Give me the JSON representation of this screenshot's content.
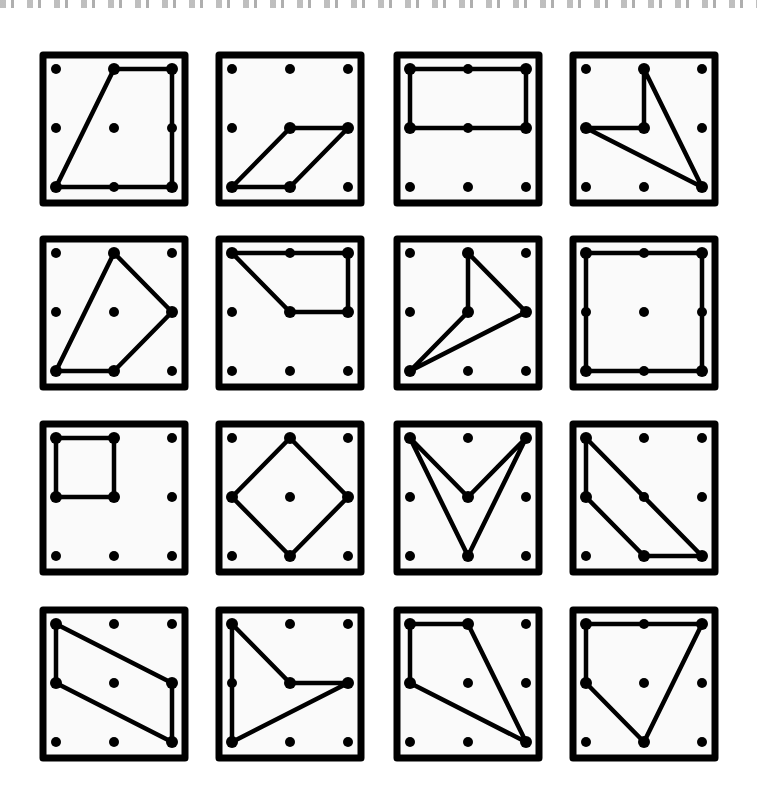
{
  "figure": {
    "grid_size": 3,
    "stroke_color": "#000000",
    "background_color": "#ffffff",
    "board_fill": "#fafafa",
    "boards": [
      {
        "id": 1,
        "row": 0,
        "col": 0,
        "vertices": [
          [
            1,
            0
          ],
          [
            2,
            0
          ],
          [
            2,
            2
          ],
          [
            0,
            2
          ]
        ]
      },
      {
        "id": 2,
        "row": 0,
        "col": 1,
        "vertices": [
          [
            1,
            1
          ],
          [
            2,
            1
          ],
          [
            1,
            2
          ],
          [
            0,
            2
          ]
        ]
      },
      {
        "id": 3,
        "row": 0,
        "col": 2,
        "vertices": [
          [
            0,
            0
          ],
          [
            2,
            0
          ],
          [
            2,
            1
          ],
          [
            0,
            1
          ]
        ]
      },
      {
        "id": 4,
        "row": 0,
        "col": 3,
        "vertices": [
          [
            1,
            0
          ],
          [
            2,
            2
          ],
          [
            0,
            1
          ],
          [
            1,
            1
          ]
        ]
      },
      {
        "id": 5,
        "row": 1,
        "col": 0,
        "vertices": [
          [
            1,
            0
          ],
          [
            2,
            1
          ],
          [
            1,
            2
          ],
          [
            0,
            2
          ]
        ]
      },
      {
        "id": 6,
        "row": 1,
        "col": 1,
        "vertices": [
          [
            0,
            0
          ],
          [
            2,
            0
          ],
          [
            2,
            1
          ],
          [
            1,
            1
          ]
        ]
      },
      {
        "id": 7,
        "row": 1,
        "col": 2,
        "vertices": [
          [
            1,
            0
          ],
          [
            2,
            1
          ],
          [
            0,
            2
          ],
          [
            1,
            1
          ]
        ]
      },
      {
        "id": 8,
        "row": 1,
        "col": 3,
        "vertices": [
          [
            0,
            0
          ],
          [
            2,
            0
          ],
          [
            2,
            2
          ],
          [
            0,
            2
          ]
        ]
      },
      {
        "id": 9,
        "row": 2,
        "col": 0,
        "vertices": [
          [
            0,
            0
          ],
          [
            1,
            0
          ],
          [
            1,
            1
          ],
          [
            0,
            1
          ]
        ]
      },
      {
        "id": 10,
        "row": 2,
        "col": 1,
        "vertices": [
          [
            1,
            0
          ],
          [
            2,
            1
          ],
          [
            1,
            2
          ],
          [
            0,
            1
          ]
        ]
      },
      {
        "id": 11,
        "row": 2,
        "col": 2,
        "vertices": [
          [
            0,
            0
          ],
          [
            1,
            1
          ],
          [
            2,
            0
          ],
          [
            1,
            2
          ]
        ]
      },
      {
        "id": 12,
        "row": 2,
        "col": 3,
        "vertices": [
          [
            0,
            0
          ],
          [
            2,
            2
          ],
          [
            1,
            2
          ],
          [
            0,
            1
          ]
        ]
      },
      {
        "id": 13,
        "row": 3,
        "col": 0,
        "vertices": [
          [
            0,
            0
          ],
          [
            2,
            1
          ],
          [
            2,
            2
          ],
          [
            0,
            1
          ]
        ]
      },
      {
        "id": 14,
        "row": 3,
        "col": 1,
        "vertices": [
          [
            0,
            0
          ],
          [
            1,
            1
          ],
          [
            2,
            1
          ],
          [
            0,
            2
          ]
        ]
      },
      {
        "id": 15,
        "row": 3,
        "col": 2,
        "vertices": [
          [
            0,
            0
          ],
          [
            1,
            0
          ],
          [
            2,
            2
          ],
          [
            0,
            1
          ]
        ]
      },
      {
        "id": 16,
        "row": 3,
        "col": 3,
        "vertices": [
          [
            0,
            0
          ],
          [
            2,
            0
          ],
          [
            1,
            2
          ],
          [
            0,
            1
          ]
        ]
      }
    ]
  }
}
